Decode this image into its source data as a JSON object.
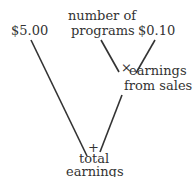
{
  "diagram": {
    "type": "calculation-tree",
    "nodes": {
      "price": {
        "label": "$5.00"
      },
      "programs": {
        "line1": "number of",
        "line2": "programs"
      },
      "unit_earning": {
        "label": "$0.10"
      },
      "sales_earnings": {
        "line1": "earnings",
        "line2": "from sales"
      },
      "total": {
        "line1": "total",
        "line2": "earnings"
      }
    },
    "operators": {
      "multiply": "×",
      "add": "+"
    },
    "edges": [
      {
        "from": "price",
        "to": "total",
        "via": "add"
      },
      {
        "from": "programs",
        "to": "sales_earnings",
        "via": "multiply"
      },
      {
        "from": "unit_earning",
        "to": "sales_earnings",
        "via": "multiply"
      },
      {
        "from": "sales_earnings",
        "to": "total",
        "via": "add"
      }
    ],
    "line_color": "#333333"
  }
}
